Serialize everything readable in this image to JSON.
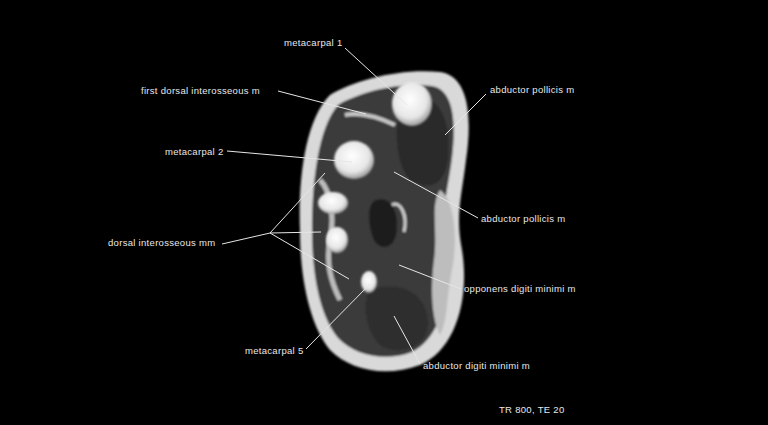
{
  "image": {
    "type": "MRI axial cross-section of hand (T1-weighted)",
    "background_color": "#000000",
    "label_color": "#e8e8e8"
  },
  "labels": {
    "metacarpal_1": "metacarpal 1",
    "first_dorsal_interosseous": "first dorsal interosseous m",
    "metacarpal_2": "metacarpal 2",
    "abductor_pollicis_top": "abductor pollicis m",
    "abductor_pollicis_mid": "abductor pollicis m",
    "dorsal_interosseous": "dorsal interosseous mm",
    "opponens_digiti_minimi": "opponens digiti minimi m",
    "metacarpal_5": "metacarpal 5",
    "abductor_digiti_minimi": "abductor digiti minimi m"
  },
  "sequence_params": "TR 800, TE 20"
}
